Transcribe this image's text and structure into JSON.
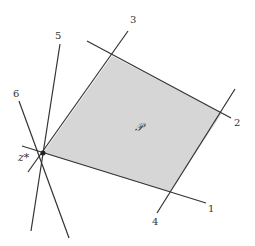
{
  "diagram": {
    "polygon_label": "𝒫",
    "point_label": "z*",
    "line_labels": [
      "1",
      "2",
      "3",
      "4",
      "5",
      "6"
    ],
    "colors": {
      "fill": "#d6d6d6",
      "line": "#333333",
      "background": "#ffffff"
    }
  }
}
